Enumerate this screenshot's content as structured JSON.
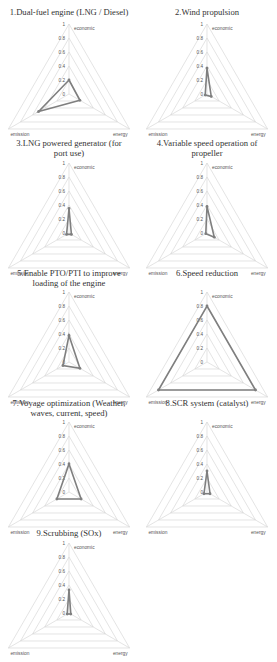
{
  "chart_data": [
    {
      "type": "radar",
      "title": "1.Dual-fuel engine (LNG / Diesel)",
      "axes": [
        "economic",
        "energy",
        "emission"
      ],
      "values": [
        0.2,
        0.18,
        0.5
      ],
      "rlim": [
        0,
        1
      ],
      "ticks": [
        "0",
        "0.2",
        "0.4",
        "0.6",
        "0.8",
        "1"
      ],
      "grid": true
    },
    {
      "type": "radar",
      "title": "2.Wind propulsion",
      "axes": [
        "economic",
        "energy",
        "emission"
      ],
      "values": [
        0.37,
        0.07,
        0.03
      ],
      "rlim": [
        0,
        1
      ],
      "ticks": [
        "0",
        "0.2",
        "0.4",
        "0.6",
        "0.8",
        "1"
      ],
      "grid": true
    },
    {
      "type": "radar",
      "title": "3.LNG powered generator (for port use)",
      "axes": [
        "economic",
        "energy",
        "emission"
      ],
      "values": [
        0.35,
        0.04,
        0.04
      ],
      "rlim": [
        0,
        1
      ],
      "ticks": [
        "0",
        "0.2",
        "0.4",
        "0.6",
        "0.8",
        "1"
      ],
      "grid": true
    },
    {
      "type": "radar",
      "title": "4.Variable speed operation of propeller",
      "axes": [
        "economic",
        "energy",
        "emission"
      ],
      "values": [
        0.38,
        0.12,
        0.02
      ],
      "rlim": [
        0,
        1
      ],
      "ticks": [
        "0",
        "0.2",
        "0.4",
        "0.6",
        "0.8",
        "1"
      ],
      "grid": true
    },
    {
      "type": "radar",
      "title": "5.Enable PTO/PTI to improve loading of the engine",
      "axes": [
        "economic",
        "energy",
        "emission"
      ],
      "values": [
        0.38,
        0.18,
        0.1
      ],
      "rlim": [
        0,
        1
      ],
      "ticks": [
        "0",
        "0.2",
        "0.4",
        "0.6",
        "0.8",
        "1"
      ],
      "grid": true
    },
    {
      "type": "radar",
      "title": "6.Speed reduction",
      "axes": [
        "economic",
        "energy",
        "emission"
      ],
      "values": [
        0.8,
        0.8,
        0.8
      ],
      "rlim": [
        0,
        1
      ],
      "ticks": [
        "0",
        "0.2",
        "0.4",
        "0.6",
        "0.8",
        "1"
      ],
      "grid": true
    },
    {
      "type": "radar",
      "title": "7.Voyage optimization (Weather, waves, current, speed)",
      "axes": [
        "economic",
        "energy",
        "emission"
      ],
      "values": [
        0.4,
        0.2,
        0.2
      ],
      "rlim": [
        0,
        1
      ],
      "ticks": [
        "0",
        "0.2",
        "0.4",
        "0.6",
        "0.8",
        "1"
      ],
      "grid": true
    },
    {
      "type": "radar",
      "title": "8.SCR system (catalyst)",
      "axes": [
        "economic",
        "energy",
        "emission"
      ],
      "values": [
        0.3,
        0.05,
        0.05
      ],
      "rlim": [
        0,
        1
      ],
      "ticks": [
        "0",
        "0.2",
        "0.4",
        "0.6",
        "0.8",
        "1"
      ],
      "grid": true
    },
    {
      "type": "radar",
      "title": "9.Scrubbing (SOx)",
      "axes": [
        "economic",
        "energy",
        "emission"
      ],
      "values": [
        0.33,
        0.03,
        0.03
      ],
      "rlim": [
        0,
        1
      ],
      "ticks": [
        "0",
        "0.2",
        "0.4",
        "0.6",
        "0.8",
        "1"
      ],
      "grid": true
    }
  ],
  "panels": [
    {
      "title_lines": [
        "1.Dual-fuel engine (LNG / Diesel)"
      ]
    },
    {
      "title_lines": [
        "2.Wind propulsion"
      ]
    },
    {
      "title_lines": [
        "3.LNG powered generator (for",
        "port use)"
      ]
    },
    {
      "title_lines": [
        "4.Variable speed operation of",
        "propeller"
      ]
    },
    {
      "title_lines": [
        "5.Enable PTO/PTI to improve",
        "loading of the engine"
      ]
    },
    {
      "title_lines": [
        "6.Speed reduction"
      ]
    },
    {
      "title_lines": [
        "7.Voyage optimization (Weather,",
        "waves, current, speed)"
      ]
    },
    {
      "title_lines": [
        "8.SCR system (catalyst)"
      ]
    },
    {
      "title_lines": [
        "9.Scrubbing (SOx)"
      ]
    }
  ],
  "colors": {
    "series": "#7f7f7f",
    "grid": "#d9d9d9",
    "text": "#555555"
  }
}
